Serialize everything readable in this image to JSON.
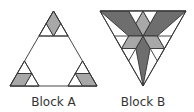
{
  "figure": {
    "blocks": [
      {
        "id": "A",
        "label": "Block A",
        "orientation": "upward"
      },
      {
        "id": "B",
        "label": "Block B",
        "orientation": "downward"
      }
    ],
    "colors": {
      "dark_fill": "#6e6e6e",
      "light_fill": "#a8a8a8",
      "white_fill": "#ffffff",
      "stroke": "#333333"
    }
  }
}
